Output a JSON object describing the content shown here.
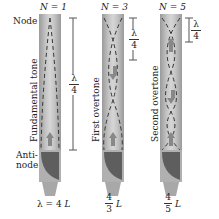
{
  "tubes": [
    {
      "id": "n1",
      "label": "N = 1",
      "side_label": "Fundamental tone",
      "wavelength_fraction_num": "λ",
      "wavelength_fraction_den": "4",
      "formula_num": "λ = 4",
      "formula_var": "L"
    },
    {
      "id": "n3",
      "label": "N = 3",
      "side_label": "First overtone",
      "wavelength_fraction_num": "λ",
      "wavelength_fraction_den": "4",
      "formula_num": "4",
      "formula_den": "3",
      "formula_var": "L"
    },
    {
      "id": "n5",
      "label": "N = 5",
      "side_label": "Second overtone",
      "wavelength_fraction_num": "λ",
      "wavelength_fraction_den": "4",
      "formula_num": "4",
      "formula_den": "5",
      "formula_var": "L"
    }
  ],
  "annotations": {
    "node": "Node",
    "antinode_line1": "Anti-",
    "antinode_line2": "node"
  },
  "colors": {
    "tube": "#c4c4c4",
    "tube_edge": "#9a9a9a",
    "base_dark": "#6a6a6a",
    "dash": "#333333"
  }
}
